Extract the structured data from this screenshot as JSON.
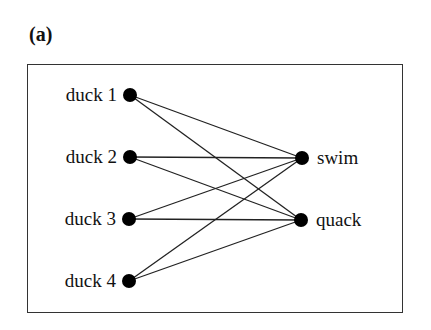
{
  "figure": {
    "panel_label": "(a)"
  },
  "graph": {
    "type": "bipartite",
    "left_nodes": [
      {
        "id": "duck1",
        "label": "duck 1",
        "x": 130,
        "y": 95
      },
      {
        "id": "duck2",
        "label": "duck 2",
        "x": 130,
        "y": 157
      },
      {
        "id": "duck3",
        "label": "duck 3",
        "x": 129,
        "y": 219
      },
      {
        "id": "duck4",
        "label": "duck 4",
        "x": 129,
        "y": 281
      }
    ],
    "right_nodes": [
      {
        "id": "swim",
        "label": "swim",
        "x": 302,
        "y": 158
      },
      {
        "id": "quack",
        "label": "quack",
        "x": 301,
        "y": 220
      }
    ],
    "edges": [
      [
        "duck1",
        "swim"
      ],
      [
        "duck1",
        "quack"
      ],
      [
        "duck2",
        "swim"
      ],
      [
        "duck2",
        "quack"
      ],
      [
        "duck3",
        "swim"
      ],
      [
        "duck3",
        "quack"
      ],
      [
        "duck4",
        "swim"
      ],
      [
        "duck4",
        "quack"
      ]
    ]
  },
  "colors": {
    "node": "#000000",
    "edge": "#222222",
    "frame": "#333333"
  }
}
